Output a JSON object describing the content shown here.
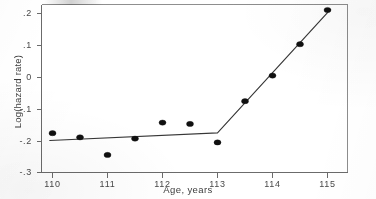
{
  "chart_data": {
    "type": "scatter",
    "title": "",
    "xlabel": "Age, years",
    "ylabel": "Log(hazard rate)",
    "xlim": [
      109.7,
      115.6
    ],
    "ylim": [
      -0.31,
      0.23
    ],
    "xticks": [
      110,
      111,
      112,
      113,
      114,
      115
    ],
    "xticklabels": [
      "110",
      "111",
      "112",
      "113",
      "114",
      "115"
    ],
    "yticks": [
      0.2,
      0.1,
      0,
      -0.1,
      -0.2,
      -0.3
    ],
    "yticklabels": [
      ".2",
      ".1",
      "0",
      "-.1",
      "-.2",
      "-.3"
    ],
    "grid": false,
    "legend": false,
    "series": [
      {
        "name": "Observed log hazard rate",
        "type": "scatter",
        "marker": "filled-circle",
        "color": "#141414",
        "x": [
          110,
          110.5,
          111,
          111.5,
          112,
          112.5,
          113,
          113.5,
          114,
          114.5,
          115
        ],
        "y": [
          -0.174,
          -0.187,
          -0.242,
          -0.191,
          -0.141,
          -0.145,
          -0.203,
          -0.074,
          0.006,
          0.104,
          0.211
        ]
      },
      {
        "name": "Piecewise linear fit",
        "type": "line",
        "color": "#3a3a3a",
        "breakpoint": 113,
        "x": [
          109.95,
          113,
          115.05
        ],
        "y": [
          -0.197,
          -0.173,
          0.212
        ]
      }
    ],
    "annotations": []
  },
  "axis": {
    "x_title": "Age, years",
    "y_title": "Log(hazard rate)"
  }
}
